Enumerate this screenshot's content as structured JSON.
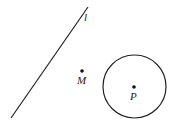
{
  "diagram": {
    "line": {
      "label": "l",
      "x1": 11,
      "y1": 118,
      "x2": 88,
      "y2": 7,
      "label_x": 84,
      "label_y": 21,
      "color": "#222222"
    },
    "point_m": {
      "label": "M",
      "cx": 82,
      "cy": 71,
      "label_x": 77,
      "label_y": 84
    },
    "circle": {
      "cx": 134.5,
      "cy": 86.5,
      "r": 31.5,
      "color": "#222222"
    },
    "point_p": {
      "label": "P",
      "cx": 134,
      "cy": 87,
      "label_x": 130,
      "label_y": 100
    }
  }
}
